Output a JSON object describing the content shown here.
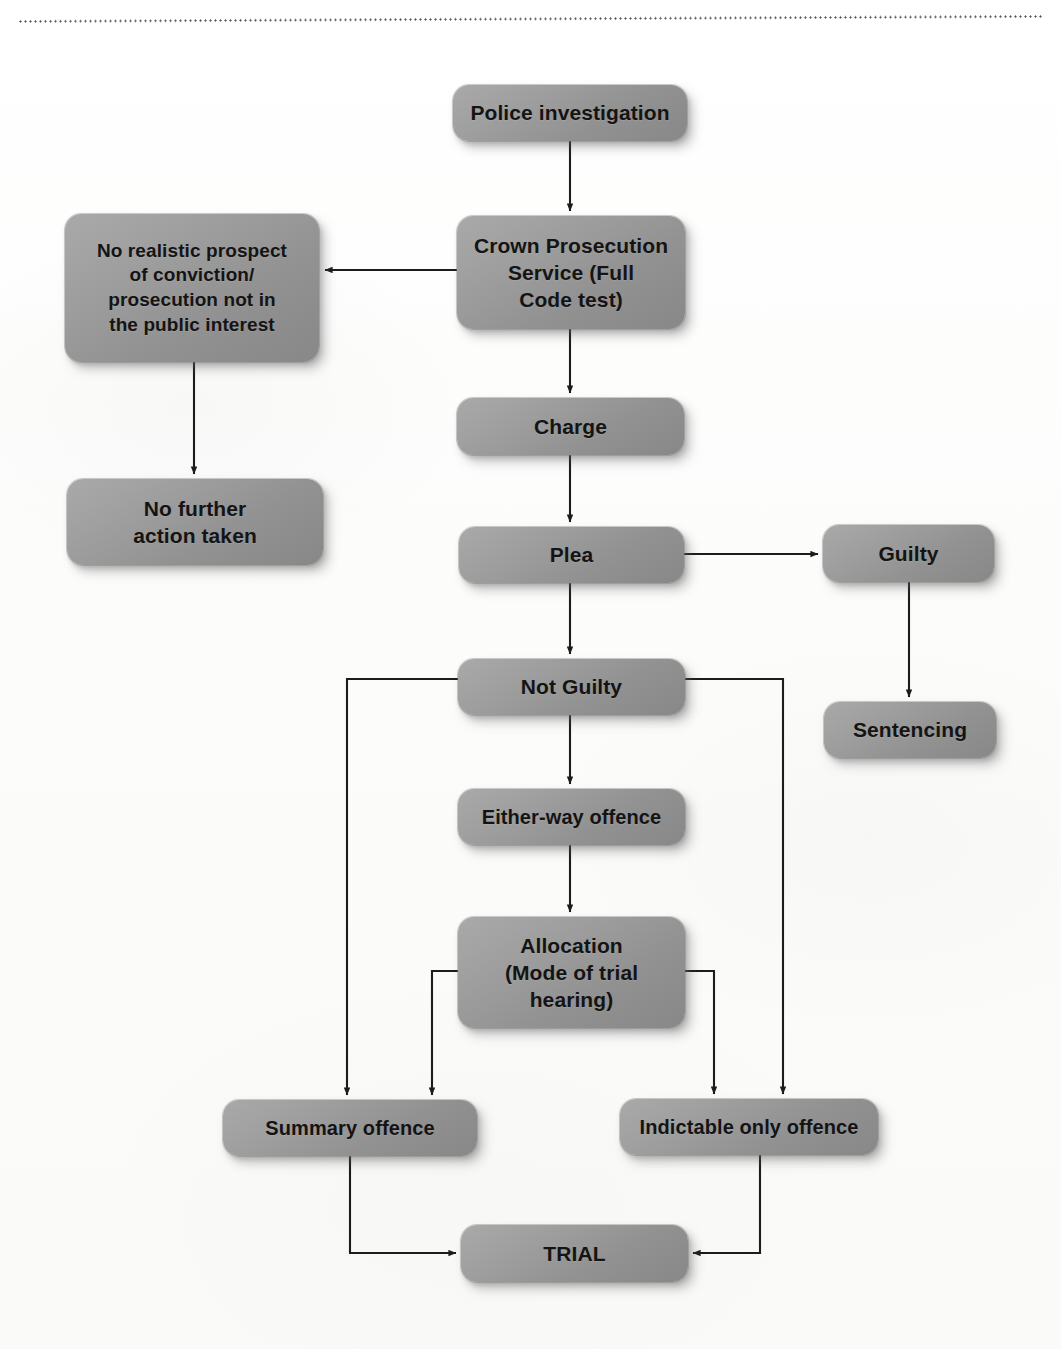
{
  "page": {
    "width": 1061,
    "height": 1349,
    "background_color": "#fdfdfc",
    "decoration": "dotted-rule"
  },
  "diagram": {
    "node_fill_color": "#9a9a9a",
    "node_text_color": "#141414",
    "connector_color": "#1c1c1c",
    "nodes": [
      {
        "id": "police-investigation",
        "label": "Police investigation",
        "x": 453,
        "y": 85,
        "w": 234,
        "h": 56,
        "font_size": 21
      },
      {
        "id": "crown-prosecution-service",
        "label": "Crown Prosecution\nService (Full\nCode test)",
        "x": 457,
        "y": 216,
        "w": 228,
        "h": 113,
        "font_size": 21
      },
      {
        "id": "no-realistic-prospect",
        "label": "No realistic prospect\nof conviction/\nprosecution not in\nthe public interest",
        "x": 65,
        "y": 214,
        "w": 254,
        "h": 148,
        "font_size": 19
      },
      {
        "id": "no-further-action",
        "label": "No further\naction taken",
        "x": 67,
        "y": 479,
        "w": 256,
        "h": 86,
        "font_size": 21
      },
      {
        "id": "charge",
        "label": "Charge",
        "x": 457,
        "y": 398,
        "w": 227,
        "h": 57,
        "font_size": 21
      },
      {
        "id": "plea",
        "label": "Plea",
        "x": 459,
        "y": 527,
        "w": 225,
        "h": 56,
        "font_size": 21
      },
      {
        "id": "guilty",
        "label": "Guilty",
        "x": 823,
        "y": 525,
        "w": 171,
        "h": 57,
        "font_size": 21
      },
      {
        "id": "sentencing",
        "label": "Sentencing",
        "x": 824,
        "y": 702,
        "w": 172,
        "h": 56,
        "font_size": 21
      },
      {
        "id": "not-guilty",
        "label": "Not Guilty",
        "x": 458,
        "y": 659,
        "w": 227,
        "h": 56,
        "font_size": 21
      },
      {
        "id": "either-way-offence",
        "label": "Either-way offence",
        "x": 458,
        "y": 789,
        "w": 227,
        "h": 56,
        "font_size": 20
      },
      {
        "id": "allocation",
        "label": "Allocation\n(Mode of trial\nhearing)",
        "x": 458,
        "y": 917,
        "w": 227,
        "h": 111,
        "font_size": 21
      },
      {
        "id": "summary-offence",
        "label": "Summary offence",
        "x": 223,
        "y": 1100,
        "w": 254,
        "h": 56,
        "font_size": 20
      },
      {
        "id": "indictable-only-offence",
        "label": "Indictable only offence",
        "x": 620,
        "y": 1099,
        "w": 258,
        "h": 56,
        "font_size": 20
      },
      {
        "id": "trial",
        "label": "TRIAL",
        "x": 461,
        "y": 1225,
        "w": 227,
        "h": 57,
        "font_size": 21
      }
    ],
    "edges": [
      {
        "id": "police-to-cps",
        "from": "police-investigation",
        "to": "crown-prosecution-service",
        "kind": "vertical-arrow"
      },
      {
        "id": "cps-to-no-realistic-prospect",
        "from": "crown-prosecution-service",
        "to": "no-realistic-prospect",
        "kind": "horizontal-arrow-left"
      },
      {
        "id": "no-realistic-prospect-to-no-further-action",
        "from": "no-realistic-prospect",
        "to": "no-further-action",
        "kind": "vertical-arrow"
      },
      {
        "id": "cps-to-charge",
        "from": "crown-prosecution-service",
        "to": "charge",
        "kind": "vertical-arrow"
      },
      {
        "id": "charge-to-plea",
        "from": "charge",
        "to": "plea",
        "kind": "vertical-arrow"
      },
      {
        "id": "plea-to-guilty",
        "from": "plea",
        "to": "guilty",
        "kind": "horizontal-arrow-right"
      },
      {
        "id": "guilty-to-sentencing",
        "from": "guilty",
        "to": "sentencing",
        "kind": "vertical-arrow"
      },
      {
        "id": "plea-to-not-guilty",
        "from": "plea",
        "to": "not-guilty",
        "kind": "vertical-arrow"
      },
      {
        "id": "not-guilty-to-either-way",
        "from": "not-guilty",
        "to": "either-way-offence",
        "kind": "vertical-arrow"
      },
      {
        "id": "not-guilty-to-summary",
        "from": "not-guilty",
        "to": "summary-offence",
        "kind": "elbow-left"
      },
      {
        "id": "not-guilty-to-indictable",
        "from": "not-guilty",
        "to": "indictable-only-offence",
        "kind": "elbow-right"
      },
      {
        "id": "either-way-to-allocation",
        "from": "either-way-offence",
        "to": "allocation",
        "kind": "vertical-arrow"
      },
      {
        "id": "allocation-to-summary",
        "from": "allocation",
        "to": "summary-offence",
        "kind": "elbow-left"
      },
      {
        "id": "allocation-to-indictable",
        "from": "allocation",
        "to": "indictable-only-offence",
        "kind": "elbow-right"
      },
      {
        "id": "summary-to-trial",
        "from": "summary-offence",
        "to": "trial",
        "kind": "elbow-down-right"
      },
      {
        "id": "indictable-to-trial",
        "from": "indictable-only-offence",
        "to": "trial",
        "kind": "elbow-down-left"
      }
    ]
  }
}
